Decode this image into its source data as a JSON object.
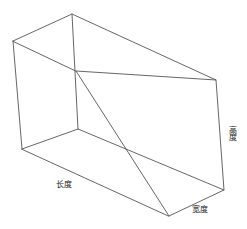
{
  "figure": {
    "type": "3d-wireframe-cuboid",
    "background_color": "#ffffff",
    "edge_color": "#555555",
    "label_color": "#1a1a1a",
    "width_px": 247,
    "height_px": 229
  },
  "labels": {
    "length": "长度",
    "width": "宽度",
    "height": "高度"
  },
  "geometry": {
    "vertices": {
      "top_back_left": [
        13,
        41
      ],
      "top_back_right": [
        72,
        14
      ],
      "top_front_right": [
        216,
        80
      ],
      "top_front_left": [
        76,
        71
      ],
      "bottom_back_left": [
        22,
        149
      ],
      "bottom_back_right": [
        78,
        129
      ],
      "bottom_front_right": [
        224,
        190
      ],
      "bottom_front_left": [
        169,
        216
      ]
    },
    "edges": [
      [
        "top_back_left",
        "top_back_right"
      ],
      [
        "top_back_right",
        "top_front_right"
      ],
      [
        "top_front_right",
        "top_front_left"
      ],
      [
        "top_front_left",
        "top_back_left"
      ],
      [
        "bottom_back_left",
        "bottom_back_right"
      ],
      [
        "bottom_back_right",
        "bottom_front_right"
      ],
      [
        "bottom_front_right",
        "bottom_front_left"
      ],
      [
        "bottom_front_left",
        "bottom_back_left"
      ],
      [
        "top_back_left",
        "bottom_back_left"
      ],
      [
        "top_back_right",
        "bottom_back_right"
      ],
      [
        "top_front_right",
        "bottom_front_right"
      ],
      [
        "top_front_left",
        "bottom_front_left"
      ]
    ]
  }
}
